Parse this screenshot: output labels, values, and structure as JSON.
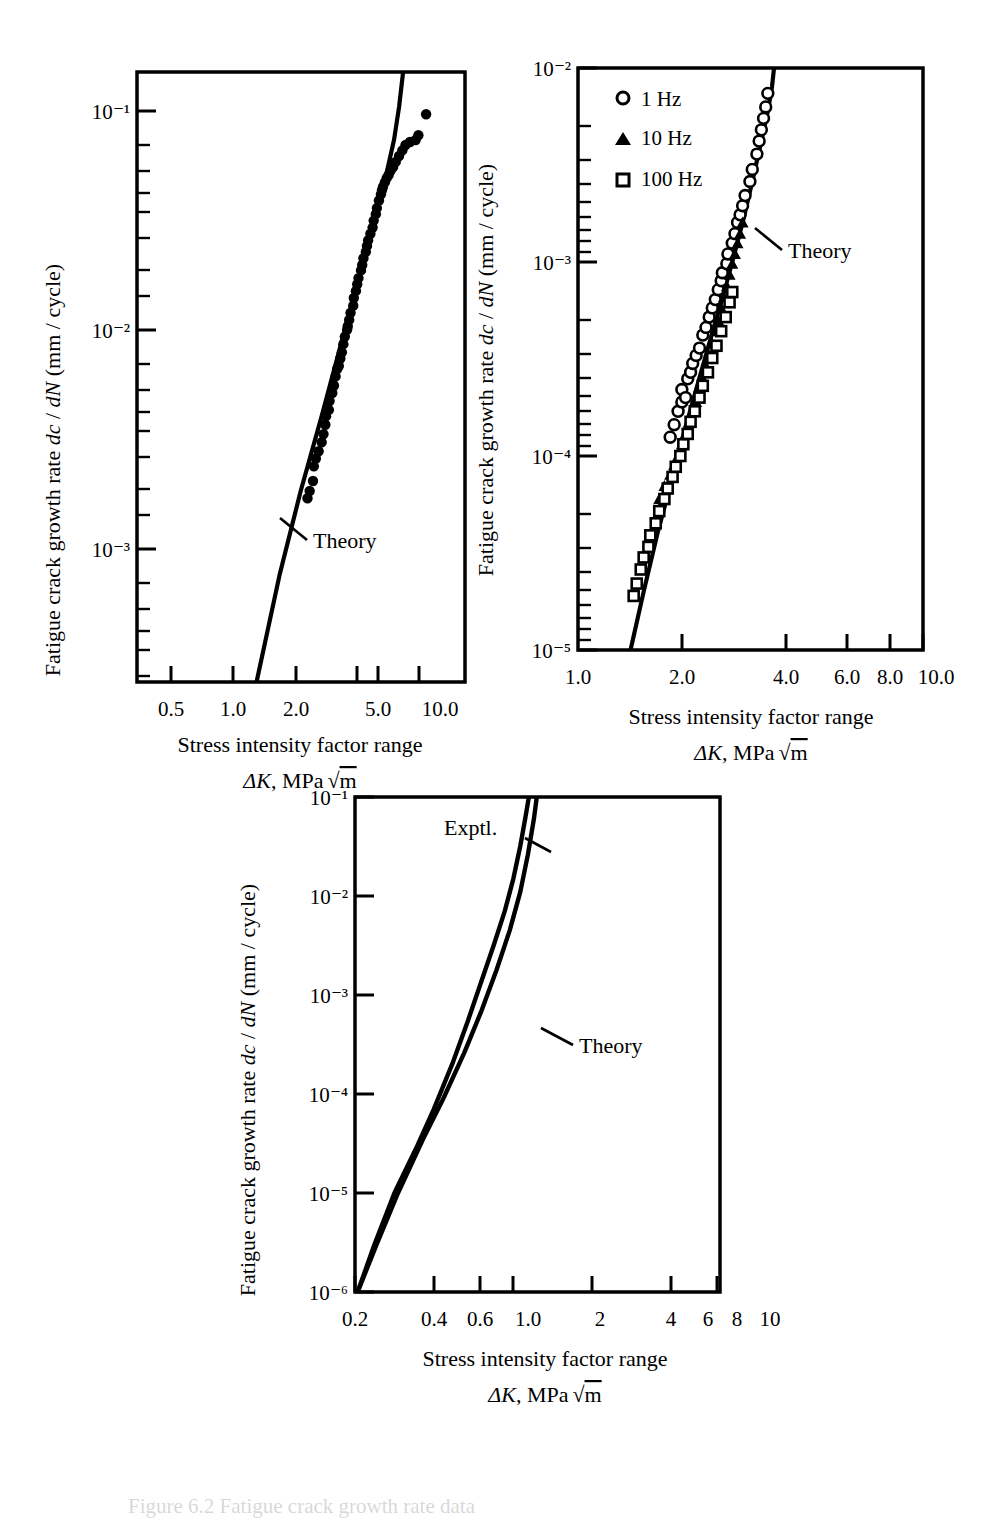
{
  "figure": {
    "caption": "Figure 6.2  Fatigue crack growth rate data",
    "panel_count": 3
  },
  "axis_labels": {
    "y_title_prefix": "Fatigue crack growth rate ",
    "y_title_italic1": "dc",
    "y_title_mid": " / ",
    "y_title_italic2": "dN",
    "y_title_suffix": " (mm / cycle)",
    "x_title_line1": "Stress intensity factor range",
    "x_title_delta": "ΔK",
    "x_title_rest": ", MPa",
    "x_title_radicand": "m"
  },
  "annotations": {
    "theory": "Theory",
    "exptl": "Exptl."
  },
  "legend": {
    "items": [
      {
        "marker": "open-circle",
        "label": "1 Hz"
      },
      {
        "marker": "filled-triangle",
        "label": "10 Hz"
      },
      {
        "marker": "open-square",
        "label": "100 Hz"
      }
    ]
  },
  "chart_data": [
    {
      "id": "panel-a",
      "type": "scatter",
      "title": "",
      "xlabel": "Stress intensity factor range ΔK, MPa √m",
      "ylabel": "Fatigue crack growth rate dc / dN (mm / cycle)",
      "xscale": "log",
      "yscale": "log",
      "xlim": [
        0.35,
        11.5
      ],
      "ylim": [
        0.0004,
        0.2
      ],
      "xticks": [
        0.5,
        1.0,
        2.0,
        5.0,
        10.0
      ],
      "xticklabels": [
        "0.5",
        "1.0",
        "2.0",
        "5.0",
        "10.0"
      ],
      "yticks": [
        0.001,
        0.01,
        0.1
      ],
      "yticklabels": [
        "10⁻³",
        "10⁻²",
        "10⁻¹"
      ],
      "grid": false,
      "legend": "none",
      "series": [
        {
          "name": "Experimental data",
          "marker": "filled-circle",
          "points": [
            [
              2.15,
              0.0026
            ],
            [
              2.2,
              0.0028
            ],
            [
              2.28,
              0.0031
            ],
            [
              2.3,
              0.0036
            ],
            [
              2.35,
              0.0039
            ],
            [
              2.42,
              0.0042
            ],
            [
              2.5,
              0.0046
            ],
            [
              2.55,
              0.005
            ],
            [
              2.6,
              0.0055
            ],
            [
              2.62,
              0.006
            ],
            [
              2.7,
              0.0064
            ],
            [
              2.72,
              0.007
            ],
            [
              2.8,
              0.0076
            ],
            [
              2.85,
              0.0082
            ],
            [
              2.9,
              0.009
            ],
            [
              2.95,
              0.0097
            ],
            [
              3.0,
              0.01
            ],
            [
              3.05,
              0.0108
            ],
            [
              3.1,
              0.0115
            ],
            [
              3.15,
              0.0125
            ],
            [
              3.2,
              0.0135
            ],
            [
              3.28,
              0.0145
            ],
            [
              3.3,
              0.015
            ],
            [
              3.35,
              0.016
            ],
            [
              3.4,
              0.0172
            ],
            [
              3.5,
              0.0185
            ],
            [
              3.52,
              0.02
            ],
            [
              3.6,
              0.0215
            ],
            [
              3.65,
              0.023
            ],
            [
              3.7,
              0.0245
            ],
            [
              3.8,
              0.0265
            ],
            [
              3.85,
              0.028
            ],
            [
              3.9,
              0.03
            ],
            [
              4.0,
              0.032
            ],
            [
              4.05,
              0.034
            ],
            [
              4.1,
              0.036
            ],
            [
              4.2,
              0.0385
            ],
            [
              4.3,
              0.041
            ],
            [
              4.35,
              0.044
            ],
            [
              4.45,
              0.047
            ],
            [
              4.5,
              0.05
            ],
            [
              4.6,
              0.054
            ],
            [
              4.7,
              0.0575
            ],
            [
              4.75,
              0.06
            ],
            [
              4.8,
              0.062
            ],
            [
              4.9,
              0.065
            ],
            [
              5.0,
              0.068
            ],
            [
              5.1,
              0.07
            ],
            [
              5.2,
              0.073
            ],
            [
              5.35,
              0.076
            ],
            [
              5.5,
              0.08
            ],
            [
              5.7,
              0.085
            ],
            [
              5.9,
              0.09
            ],
            [
              6.1,
              0.095
            ],
            [
              6.4,
              0.098
            ],
            [
              6.8,
              0.1
            ],
            [
              7.0,
              0.105
            ],
            [
              7.6,
              0.13
            ]
          ]
        },
        {
          "name": "Theory",
          "type": "line",
          "points": [
            [
              1.25,
              0.0004
            ],
            [
              1.6,
              0.0012
            ],
            [
              2.0,
              0.0028
            ],
            [
              2.5,
              0.006
            ],
            [
              3.0,
              0.0115
            ],
            [
              3.5,
              0.02
            ],
            [
              4.0,
              0.032
            ],
            [
              4.5,
              0.049
            ],
            [
              5.0,
              0.072
            ],
            [
              5.4,
              0.1
            ],
            [
              5.7,
              0.14
            ],
            [
              5.95,
              0.2
            ]
          ]
        }
      ]
    },
    {
      "id": "panel-b",
      "type": "scatter",
      "title": "",
      "xlabel": "Stress intensity factor range ΔK, MPa √m",
      "ylabel": "Fatigue crack growth rate dc / dN (mm / cycle)",
      "xscale": "log",
      "yscale": "log",
      "xlim": [
        1.0,
        10.0
      ],
      "ylim": [
        1e-05,
        0.01
      ],
      "xticks": [
        1.0,
        2.0,
        4.0,
        6.0,
        8.0,
        10.0
      ],
      "xticklabels": [
        "1.0",
        "2.0",
        "4.0",
        "6.0",
        "8.0",
        "10.0"
      ],
      "yticks": [
        1e-05,
        0.0001,
        0.001,
        0.01
      ],
      "yticklabels": [
        "10⁻⁵",
        "10⁻⁴",
        "10⁻³",
        "10⁻²"
      ],
      "grid": false,
      "legend": "upper-left",
      "series": [
        {
          "name": "1 Hz",
          "marker": "open-circle",
          "points": [
            [
              1.85,
              0.000125
            ],
            [
              1.9,
              0.000145
            ],
            [
              1.95,
              0.00017
            ],
            [
              2.0,
              0.00019
            ],
            [
              2.0,
              0.00022
            ],
            [
              2.05,
              0.0002
            ],
            [
              2.08,
              0.00025
            ],
            [
              2.12,
              0.00027
            ],
            [
              2.15,
              0.0003
            ],
            [
              2.2,
              0.00033
            ],
            [
              2.25,
              0.00036
            ],
            [
              2.3,
              0.00042
            ],
            [
              2.35,
              0.00046
            ],
            [
              2.4,
              0.00052
            ],
            [
              2.45,
              0.00058
            ],
            [
              2.5,
              0.00064
            ],
            [
              2.55,
              0.00072
            ],
            [
              2.6,
              0.0008
            ],
            [
              2.62,
              0.00088
            ],
            [
              2.7,
              0.00098
            ],
            [
              2.72,
              0.0011
            ],
            [
              2.8,
              0.00125
            ],
            [
              2.85,
              0.0014
            ],
            [
              2.9,
              0.0016
            ],
            [
              2.95,
              0.00175
            ],
            [
              3.0,
              0.00195
            ],
            [
              3.05,
              0.0022
            ],
            [
              3.15,
              0.0026
            ],
            [
              3.2,
              0.003
            ],
            [
              3.3,
              0.0036
            ],
            [
              3.35,
              0.0042
            ],
            [
              3.4,
              0.0048
            ],
            [
              3.45,
              0.0055
            ],
            [
              3.5,
              0.0063
            ],
            [
              3.55,
              0.0074
            ]
          ]
        },
        {
          "name": "10 Hz",
          "marker": "filled-triangle",
          "points": [
            [
              1.72,
              6e-05
            ],
            [
              1.78,
              7e-05
            ],
            [
              1.85,
              8e-05
            ],
            [
              1.9,
              9e-05
            ],
            [
              1.95,
              0.0001
            ],
            [
              2.0,
              0.000115
            ],
            [
              2.05,
              0.00013
            ],
            [
              2.1,
              0.00015
            ],
            [
              2.15,
              0.00017
            ],
            [
              2.2,
              0.00019
            ],
            [
              2.25,
              0.00022
            ],
            [
              2.3,
              0.00025
            ],
            [
              2.35,
              0.00029
            ],
            [
              2.4,
              0.00033
            ],
            [
              2.45,
              0.00038
            ],
            [
              2.5,
              0.00044
            ],
            [
              2.55,
              0.0005
            ],
            [
              2.6,
              0.00058
            ],
            [
              2.65,
              0.00066
            ],
            [
              2.7,
              0.00075
            ],
            [
              2.75,
              0.00086
            ],
            [
              2.8,
              0.00098
            ],
            [
              2.85,
              0.0011
            ],
            [
              2.9,
              0.00125
            ],
            [
              2.95,
              0.0014
            ],
            [
              3.0,
              0.0016
            ]
          ]
        },
        {
          "name": "100 Hz",
          "marker": "open-square",
          "points": [
            [
              1.45,
              1.9e-05
            ],
            [
              1.48,
              2.2e-05
            ],
            [
              1.52,
              2.6e-05
            ],
            [
              1.55,
              3e-05
            ],
            [
              1.6,
              3.4e-05
            ],
            [
              1.62,
              3.9e-05
            ],
            [
              1.68,
              4.5e-05
            ],
            [
              1.72,
              5.2e-05
            ],
            [
              1.78,
              6e-05
            ],
            [
              1.82,
              6.8e-05
            ],
            [
              1.88,
              7.8e-05
            ],
            [
              1.92,
              8.8e-05
            ],
            [
              1.98,
              0.0001
            ],
            [
              2.02,
              0.000115
            ],
            [
              2.08,
              0.00013
            ],
            [
              2.12,
              0.00015
            ],
            [
              2.18,
              0.00017
            ],
            [
              2.25,
              0.0002
            ],
            [
              2.3,
              0.00023
            ],
            [
              2.38,
              0.00027
            ],
            [
              2.45,
              0.00032
            ],
            [
              2.52,
              0.00037
            ],
            [
              2.6,
              0.00044
            ],
            [
              2.68,
              0.00052
            ],
            [
              2.75,
              0.00062
            ],
            [
              2.8,
              0.0007
            ]
          ]
        },
        {
          "name": "Theory",
          "type": "line",
          "points": [
            [
              1.42,
              1e-05
            ],
            [
              1.55,
              2e-05
            ],
            [
              1.7,
              4e-05
            ],
            [
              1.85,
              7e-05
            ],
            [
              2.0,
              0.00012
            ],
            [
              2.2,
              0.00022
            ],
            [
              2.4,
              0.00038
            ],
            [
              2.6,
              0.00062
            ],
            [
              2.8,
              0.001
            ],
            [
              3.0,
              0.0016
            ],
            [
              3.2,
              0.0026
            ],
            [
              3.4,
              0.0042
            ],
            [
              3.55,
              0.006
            ],
            [
              3.65,
              0.008
            ],
            [
              3.7,
              0.01
            ]
          ]
        }
      ]
    },
    {
      "id": "panel-c",
      "type": "line",
      "title": "",
      "xlabel": "Stress intensity factor range ΔK, MPa √m",
      "ylabel": "Fatigue crack growth rate dc / dN (mm / cycle)",
      "xscale": "log",
      "yscale": "log",
      "xlim": [
        0.2,
        10.0
      ],
      "ylim": [
        1e-06,
        0.1
      ],
      "xticks": [
        0.2,
        0.4,
        0.6,
        1.0,
        2,
        4,
        6,
        8,
        10
      ],
      "xticklabels": [
        "0.2",
        "0.4",
        "0.6",
        "1.0",
        "2",
        "4",
        "6",
        "8",
        "10"
      ],
      "yticks": [
        1e-06,
        1e-05,
        0.0001,
        0.001,
        0.01,
        0.1
      ],
      "yticklabels": [
        "10⁻⁶",
        "10⁻⁵",
        "10⁻⁴",
        "10⁻³",
        "10⁻²",
        "10⁻¹"
      ],
      "grid": false,
      "legend": "none",
      "series": [
        {
          "name": "Exptl.",
          "type": "line",
          "points": [
            [
              0.205,
              1e-06
            ],
            [
              0.24,
              3e-06
            ],
            [
              0.29,
              1e-05
            ],
            [
              0.36,
              3e-05
            ],
            [
              0.42,
              7e-05
            ],
            [
              0.5,
              0.0002
            ],
            [
              0.58,
              0.00055
            ],
            [
              0.66,
              0.0014
            ],
            [
              0.74,
              0.0032
            ],
            [
              0.82,
              0.007
            ],
            [
              0.89,
              0.015
            ],
            [
              0.95,
              0.032
            ],
            [
              1.0,
              0.065
            ],
            [
              1.03,
              0.1
            ]
          ]
        },
        {
          "name": "Theory",
          "type": "line",
          "points": [
            [
              0.205,
              1e-06
            ],
            [
              0.245,
              3e-06
            ],
            [
              0.3,
              1e-05
            ],
            [
              0.38,
              3.5e-05
            ],
            [
              0.46,
              9e-05
            ],
            [
              0.56,
              0.00026
            ],
            [
              0.66,
              0.0007
            ],
            [
              0.76,
              0.0018
            ],
            [
              0.86,
              0.0045
            ],
            [
              0.95,
              0.011
            ],
            [
              1.02,
              0.026
            ],
            [
              1.08,
              0.06
            ],
            [
              1.11,
              0.1
            ]
          ]
        }
      ]
    }
  ]
}
